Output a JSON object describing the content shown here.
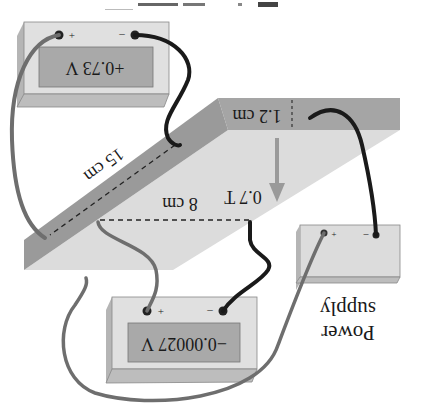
{
  "figure": {
    "orientation": "rotated 180 degrees",
    "caption_fragment": "(cut-off caption text)",
    "colors": {
      "slab_top": "#dcdcdc",
      "slab_edge": "#9e9e9e",
      "box_face": "#dedede",
      "box_side": "#b8b8b8",
      "display": "#a8a8a8",
      "wire_black": "#1a1a1a",
      "wire_gray": "#6e6e6e",
      "arrow": "#9a9a9a"
    }
  },
  "voltmeter_top": {
    "reading": "+0.73 V",
    "plus_label": "+",
    "minus_label": "–"
  },
  "voltmeter_bottom": {
    "reading": "−0.00027 V",
    "plus_label": "+",
    "minus_label": "–"
  },
  "power_supply": {
    "label_line1": "Power",
    "label_line2": "supply",
    "plus_label": "+",
    "minus_label": "–"
  },
  "slab": {
    "thickness_label": "1.2 cm",
    "length_label": "15 cm",
    "width_label": "8 cm"
  },
  "magnetic_field": {
    "label": "0.7 T"
  }
}
